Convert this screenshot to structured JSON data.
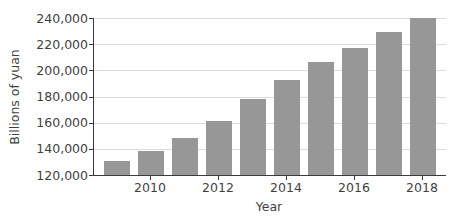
{
  "chart_data": {
    "type": "bar",
    "title": "",
    "xlabel": "Year",
    "ylabel": "Billions of yuan",
    "categories": [
      "2009",
      "2010",
      "2011",
      "2012",
      "2013",
      "2014",
      "2015",
      "2016",
      "2017",
      "2018"
    ],
    "values": [
      131000,
      138000,
      148500,
      161500,
      178000,
      193000,
      206000,
      217000,
      229000,
      240000
    ],
    "ylim": [
      120000,
      240000
    ],
    "ytick_step": 20000,
    "ytick_labels": [
      "240,000",
      "220,000",
      "200,000",
      "180,000",
      "160,000",
      "140,000",
      "120,000"
    ],
    "xtick_labels": [
      "2010",
      "2012",
      "2014",
      "2016",
      "2018"
    ],
    "grid": "horizontal",
    "legend": "none",
    "bar_color": "#979797",
    "text_color": "#3f3f3f",
    "grid_color": "#dcdcdc",
    "axis_color": "#3a3a3a"
  }
}
